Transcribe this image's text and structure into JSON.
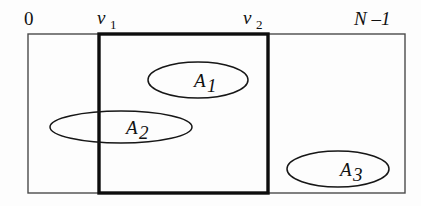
{
  "figure": {
    "background_color": "#fdfdfd",
    "stroke_color": "#161616",
    "outer_stroke_color": "#4a4a4a",
    "bold_stroke_color": "#0d0d0d"
  },
  "axis": {
    "start_label": "0",
    "window_start_label": "v",
    "window_start_sub": "1",
    "window_end_label": "v",
    "window_end_sub": "2",
    "end_label": "N –1"
  },
  "outer_region": {
    "x": 28,
    "y": 34,
    "width": 377,
    "height": 159
  },
  "window_region": {
    "x": 99,
    "y": 34,
    "width": 169,
    "height": 159
  },
  "sets": [
    {
      "label": "A",
      "sub": "1",
      "cx": 198,
      "cy": 80,
      "rx": 50,
      "ry": 18,
      "label_x": 194,
      "label_y": 87,
      "sub_x": 207,
      "sub_y": 92
    },
    {
      "label": "A",
      "sub": "2",
      "cx": 121,
      "cy": 127,
      "rx": 71,
      "ry": 16,
      "label_x": 126,
      "label_y": 134,
      "sub_x": 139,
      "sub_y": 139
    },
    {
      "label": "A",
      "sub": "3",
      "cx": 338,
      "cy": 169,
      "rx": 51,
      "ry": 18,
      "label_x": 340,
      "label_y": 176,
      "sub_x": 353,
      "sub_y": 181
    }
  ],
  "label_positions": {
    "start": {
      "x": 24,
      "y": 25
    },
    "window_start": {
      "x": 97,
      "y": 24
    },
    "window_start_sub": {
      "x": 110,
      "y": 29
    },
    "window_end": {
      "x": 243,
      "y": 24
    },
    "window_end_sub": {
      "x": 256,
      "y": 29
    },
    "end": {
      "x": 354,
      "y": 25
    }
  }
}
